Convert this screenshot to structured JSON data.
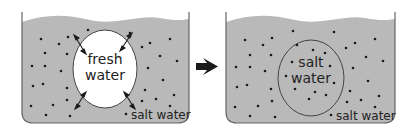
{
  "diagram": {
    "colors": {
      "salt_water": "#b9b9b9",
      "fresh_water": "#ffffff",
      "outline": "#555555",
      "dot": "#1a1a1a",
      "arrow": "#1a1a1a"
    },
    "left_panel": {
      "inner_label_line1": "fresh",
      "inner_label_line2": "water",
      "outer_label": "salt water"
    },
    "transition_arrow": "right-arrow",
    "right_panel": {
      "inner_label_line1": "salt",
      "inner_label_line2": "water",
      "outer_label": "salt water"
    }
  }
}
